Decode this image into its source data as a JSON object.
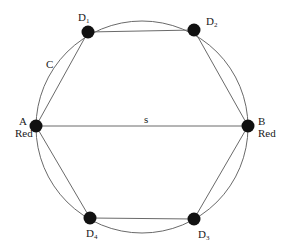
{
  "diagram": {
    "type": "graph",
    "colors": {
      "edge": "#6a6a6a",
      "node": "#111111",
      "text": "#1a1a1a"
    },
    "circle": {
      "cx": 142,
      "cy": 127,
      "r": 106
    },
    "nodes": [
      {
        "id": "A",
        "label": "A",
        "sublabel": "Red",
        "x": 36,
        "y": 126
      },
      {
        "id": "B",
        "label": "B",
        "sublabel": "Red",
        "x": 248,
        "y": 126
      },
      {
        "id": "D1",
        "label": "D",
        "subscript": "1",
        "x": 88,
        "y": 32
      },
      {
        "id": "D2",
        "label": "D",
        "subscript": "2",
        "x": 194,
        "y": 30
      },
      {
        "id": "D3",
        "label": "D",
        "subscript": "3",
        "x": 194,
        "y": 219
      },
      {
        "id": "D4",
        "label": "D",
        "subscript": "4",
        "x": 90,
        "y": 218
      }
    ],
    "edges": [
      {
        "from": "A",
        "to": "D1"
      },
      {
        "from": "D1",
        "to": "D2"
      },
      {
        "from": "D2",
        "to": "B"
      },
      {
        "from": "B",
        "to": "D3"
      },
      {
        "from": "D3",
        "to": "D4"
      },
      {
        "from": "D4",
        "to": "A"
      },
      {
        "from": "A",
        "to": "B",
        "label": "s"
      }
    ],
    "edge_labels": {
      "s": "s",
      "c": "C"
    },
    "labels": {
      "A": "A",
      "A_color": "Red",
      "B": "B",
      "B_color": "Red",
      "D": "D",
      "D1_sub": "1",
      "D2_sub": "2",
      "D3_sub": "3",
      "D4_sub": "4"
    }
  }
}
